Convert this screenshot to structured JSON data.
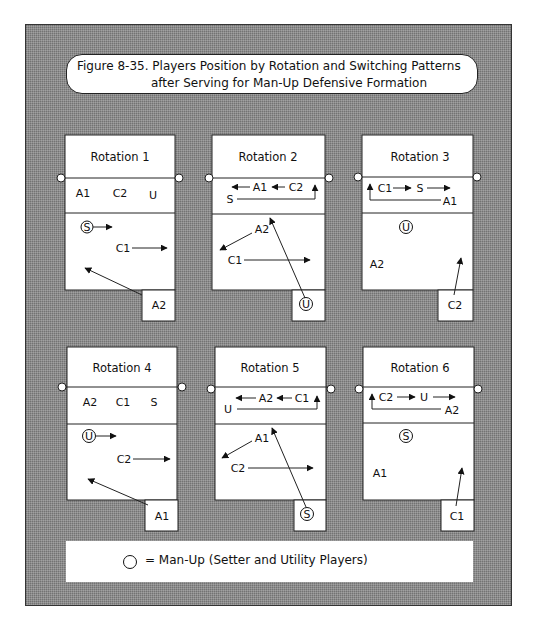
{
  "figure": {
    "title_line1": "Figure 8-35. Players Position by Rotation and Switching Patterns",
    "title_line2": "after Serving for Man-Up Defensive Formation"
  },
  "legend": {
    "symbol": "circle",
    "text": "= Man-Up (Setter and Utility Players)"
  },
  "colors": {
    "background_pattern": "#8c8c8c",
    "court": "#ffffff",
    "ink": "#111111"
  },
  "rotations": [
    {
      "title": "Rotation 1",
      "front_row": [
        "A1",
        "C2",
        "U"
      ],
      "back_row": [
        {
          "label": "S",
          "circled": true
        },
        {
          "label": "C1",
          "circled": false
        }
      ],
      "server": {
        "label": "A2",
        "circled": false
      },
      "movements": [
        "S → right",
        "C1 → right",
        "A2 → back-left"
      ]
    },
    {
      "title": "Rotation 2",
      "front_row": [
        "A1",
        "C2",
        "S"
      ],
      "back_row": [
        {
          "label": "A2",
          "circled": false
        },
        {
          "label": "C1",
          "circled": false
        }
      ],
      "server": {
        "label": "U",
        "circled": true
      },
      "movements": [
        "A1 → left",
        "C2 → left",
        "S → right-front",
        "A2 → back-left",
        "C1 → right",
        "U → front-center"
      ]
    },
    {
      "title": "Rotation 3",
      "front_row": [
        "C1",
        "S",
        "A1"
      ],
      "back_row": [
        {
          "label": "U",
          "circled": true
        },
        {
          "label": "A2",
          "circled": false
        }
      ],
      "server": {
        "label": "C2",
        "circled": false
      },
      "movements": [
        "C1 → right",
        "S → right",
        "A1 → left-front",
        "C2 → up"
      ]
    },
    {
      "title": "Rotation 4",
      "front_row": [
        "A2",
        "C1",
        "S"
      ],
      "back_row": [
        {
          "label": "U",
          "circled": true
        },
        {
          "label": "C2",
          "circled": false
        }
      ],
      "server": {
        "label": "A1",
        "circled": false
      },
      "movements": [
        "U → right",
        "C2 → right",
        "A1 → back-left"
      ]
    },
    {
      "title": "Rotation 5",
      "front_row": [
        "A2",
        "C1",
        "U"
      ],
      "back_row": [
        {
          "label": "A1",
          "circled": false
        },
        {
          "label": "C2",
          "circled": false
        }
      ],
      "server": {
        "label": "S",
        "circled": true
      },
      "movements": [
        "A2 → left",
        "C1 → left",
        "U → right-front",
        "A1 → back-left",
        "C2 → right",
        "S → front-center"
      ]
    },
    {
      "title": "Rotation 6",
      "front_row": [
        "C2",
        "U",
        "A2"
      ],
      "back_row": [
        {
          "label": "S",
          "circled": true
        },
        {
          "label": "A1",
          "circled": false
        }
      ],
      "server": {
        "label": "C1",
        "circled": false
      },
      "movements": [
        "C2 → right",
        "U → right",
        "A2 → left-front",
        "C1 → up"
      ]
    }
  ]
}
